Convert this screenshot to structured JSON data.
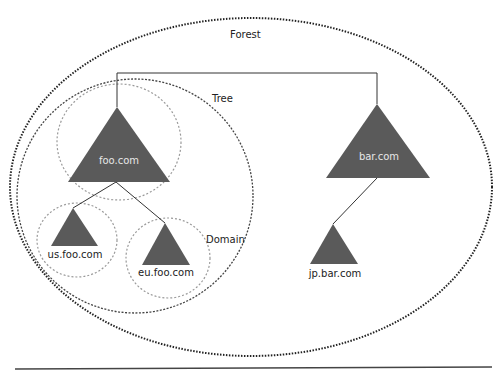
{
  "diagram": {
    "labels": {
      "forest": "Forest",
      "tree": "Tree",
      "domain": "Domain"
    },
    "nodes": [
      {
        "id": "foo",
        "label": "foo.com"
      },
      {
        "id": "bar",
        "label": "bar.com"
      },
      {
        "id": "us",
        "label": "us.foo.com"
      },
      {
        "id": "eu",
        "label": "eu.foo.com"
      },
      {
        "id": "jp",
        "label": "jp.bar.com"
      }
    ],
    "colors": {
      "triangle_fill": "#5a5a5a",
      "forest_border": "#222222",
      "tree_border": "#444444",
      "domain_border": "#999999",
      "line": "#333333"
    }
  }
}
